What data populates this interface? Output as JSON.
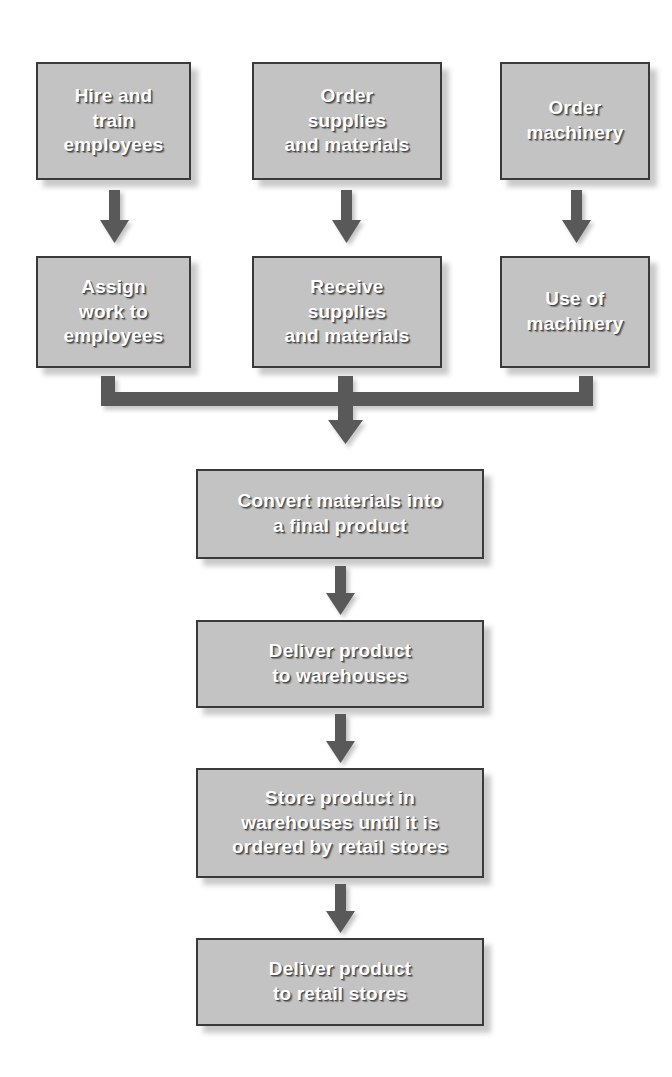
{
  "diagram": {
    "colors": {
      "box_fill": "#c3c3c3",
      "box_border": "#3a3a3a",
      "arrow": "#595959",
      "text": "#ffffff",
      "background": "#ffffff"
    },
    "nodes": [
      {
        "id": "hire-and-train-employees",
        "label": "Hire and\ntrain\nemployees",
        "row": 1,
        "column": 1
      },
      {
        "id": "order-supplies-and-materials",
        "label": "Order\nsupplies\nand materials",
        "row": 1,
        "column": 2
      },
      {
        "id": "order-machinery",
        "label": "Order\nmachinery",
        "row": 1,
        "column": 3
      },
      {
        "id": "assign-work-to-employees",
        "label": "Assign\nwork to\nemployees",
        "row": 2,
        "column": 1
      },
      {
        "id": "receive-supplies-and-materials",
        "label": "Receive\nsupplies\nand materials",
        "row": 2,
        "column": 2
      },
      {
        "id": "use-of-machinery",
        "label": "Use of\nmachinery",
        "row": 2,
        "column": 3
      },
      {
        "id": "convert-materials",
        "label": "Convert materials into\na final product",
        "row": 3,
        "column": 0
      },
      {
        "id": "deliver-to-warehouses",
        "label": "Deliver product\nto warehouses",
        "row": 4,
        "column": 0
      },
      {
        "id": "store-product",
        "label": "Store product in\nwarehouses until it is\nordered by retail stores",
        "row": 5,
        "column": 0
      },
      {
        "id": "deliver-to-retail-stores",
        "label": "Deliver product\nto retail stores",
        "row": 6,
        "column": 0
      }
    ],
    "connectors": [
      {
        "id": "arrow-hire-to-assign",
        "from": "hire-and-train-employees",
        "to": "assign-work-to-employees",
        "type": "down-arrow"
      },
      {
        "id": "arrow-order-supplies-to-receive",
        "from": "order-supplies-and-materials",
        "to": "receive-supplies-and-materials",
        "type": "down-arrow"
      },
      {
        "id": "arrow-order-machinery-to-use",
        "from": "order-machinery",
        "to": "use-of-machinery",
        "type": "down-arrow"
      },
      {
        "id": "merge-bar-to-convert",
        "from": "assign-work-to-employees, receive-supplies-and-materials, use-of-machinery",
        "to": "convert-materials",
        "type": "merge-bar"
      },
      {
        "id": "arrow-convert-to-deliver-warehouses",
        "from": "convert-materials",
        "to": "deliver-to-warehouses",
        "type": "down-arrow"
      },
      {
        "id": "arrow-deliver-warehouses-to-store",
        "from": "deliver-to-warehouses",
        "to": "store-product",
        "type": "down-arrow"
      },
      {
        "id": "arrow-store-to-deliver-retail",
        "from": "store-product",
        "to": "deliver-to-retail-stores",
        "type": "down-arrow"
      }
    ]
  }
}
